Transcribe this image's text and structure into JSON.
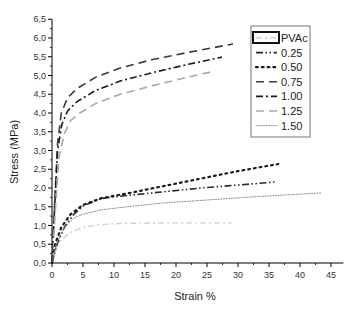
{
  "chart_data": {
    "type": "line",
    "title": "",
    "xlabel": "Strain %",
    "ylabel": "Stress (MPa)",
    "xlim": [
      0,
      47
    ],
    "ylim": [
      0,
      6.5
    ],
    "xticks": [
      0,
      5,
      10,
      15,
      20,
      25,
      30,
      35,
      40,
      45
    ],
    "xtick_labels": [
      "0",
      "5",
      "10",
      "15",
      "20",
      "25",
      "30",
      "35",
      "40",
      "45"
    ],
    "yticks": [
      0,
      0.5,
      1,
      1.5,
      2,
      2.5,
      3,
      3.5,
      4,
      4.5,
      5,
      5.5,
      6,
      6.5
    ],
    "ytick_labels": [
      "0,0",
      "0,5",
      "1,0",
      "1,5",
      "2,0",
      "2,5",
      "3,0",
      "3,5",
      "4,0",
      "4,5",
      "5,0",
      "5,5",
      "6,0",
      "6,5"
    ],
    "grid": false,
    "legend_position": "upper right",
    "series": [
      {
        "name": "PVAc",
        "color": "#cfcfcf",
        "style": "dash-dot-light",
        "x": [
          0,
          0.5,
          1.5,
          3,
          5,
          8,
          12,
          18,
          24,
          29
        ],
        "y": [
          0,
          0.35,
          0.62,
          0.82,
          0.95,
          1.03,
          1.06,
          1.07,
          1.07,
          1.07
        ]
      },
      {
        "name": "0.25",
        "color": "#2a2a2a",
        "style": "dash-dot-dot",
        "x": [
          0,
          0.8,
          2,
          3.5,
          5,
          8,
          12,
          18,
          24,
          30,
          36
        ],
        "y": [
          0,
          0.5,
          0.95,
          1.3,
          1.52,
          1.72,
          1.8,
          1.9,
          2.0,
          2.08,
          2.16
        ]
      },
      {
        "name": "0.50",
        "color": "#1a1a1a",
        "style": "dotted",
        "x": [
          0,
          0.5,
          1.5,
          3,
          5,
          8,
          12,
          18,
          24,
          30,
          36.5
        ],
        "y": [
          0,
          0.5,
          0.95,
          1.3,
          1.55,
          1.73,
          1.85,
          2.05,
          2.25,
          2.45,
          2.64
        ]
      },
      {
        "name": "0.75",
        "color": "#3a3a3a",
        "style": "dashed",
        "x": [
          0,
          0.4,
          0.9,
          1.5,
          2.5,
          4,
          7,
          11,
          16,
          22,
          29.2
        ],
        "y": [
          0,
          1.5,
          3.2,
          4.0,
          4.4,
          4.65,
          4.95,
          5.2,
          5.42,
          5.62,
          5.84
        ]
      },
      {
        "name": "1.00",
        "color": "#1a1a1a",
        "style": "dash-dot",
        "x": [
          0,
          0.4,
          0.9,
          1.6,
          2.5,
          4,
          7,
          11,
          16,
          22,
          27.4
        ],
        "y": [
          0,
          1.4,
          3.0,
          3.7,
          4.05,
          4.3,
          4.6,
          4.85,
          5.07,
          5.3,
          5.49
        ]
      },
      {
        "name": "1.25",
        "color": "#a8a8a8",
        "style": "dashed",
        "x": [
          0,
          0.5,
          1.1,
          2,
          3,
          4.5,
          7,
          11,
          16,
          21,
          25.5
        ],
        "y": [
          0,
          1.3,
          2.8,
          3.45,
          3.8,
          4.0,
          4.25,
          4.5,
          4.72,
          4.92,
          5.09
        ]
      },
      {
        "name": "1.50",
        "color": "#8a8a8a",
        "style": "dotted-fine",
        "x": [
          0,
          0.7,
          2,
          3.5,
          5,
          8,
          12,
          18,
          25,
          33,
          43.5
        ],
        "y": [
          0,
          0.5,
          0.95,
          1.2,
          1.3,
          1.42,
          1.5,
          1.6,
          1.68,
          1.77,
          1.87
        ]
      }
    ]
  }
}
